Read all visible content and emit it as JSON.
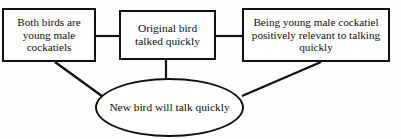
{
  "diagram": {
    "type": "argument-flow-diagram",
    "stroke_color": "#111111",
    "background_color": "#fefefe",
    "nodes": [
      {
        "id": "both-birds",
        "shape": "rectangle",
        "label": "Both birds are young male cockatiels"
      },
      {
        "id": "original-bird",
        "shape": "rectangle",
        "label": "Original bird talked quickly"
      },
      {
        "id": "relevance",
        "shape": "rectangle",
        "label": "Being young male cockatiel positively relevant to talking quickly"
      },
      {
        "id": "conclusion",
        "shape": "ellipse",
        "label": "New bird will talk quickly"
      }
    ],
    "edges": [
      {
        "id": "edge-both-to-original",
        "from": "both-birds",
        "to": "original-bird",
        "style": "horizontal-line"
      },
      {
        "id": "edge-original-to-relevance",
        "from": "original-bird",
        "to": "relevance",
        "style": "horizontal-line"
      },
      {
        "id": "edge-both-to-conclusion",
        "from": "both-birds",
        "to": "conclusion",
        "style": "diagonal-line"
      },
      {
        "id": "edge-original-to-conclusion",
        "from": "original-bird",
        "to": "conclusion",
        "style": "vertical-line"
      },
      {
        "id": "edge-relevance-to-conclusion",
        "from": "relevance",
        "to": "conclusion",
        "style": "diagonal-line"
      }
    ]
  }
}
